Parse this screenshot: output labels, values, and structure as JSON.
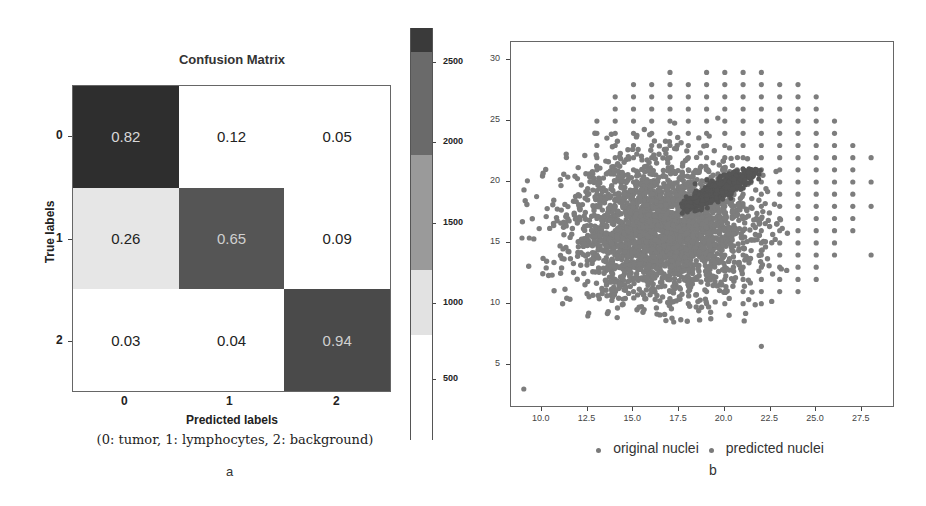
{
  "panel_a": {
    "title": "Confusion Matrix",
    "ylabel": "True labels",
    "xlabel": "Predicted labels",
    "class_note": "(0: tumor, 1: lymphocytes, 2: background)",
    "letter": "a",
    "row_ticks": [
      "0",
      "1",
      "2"
    ],
    "col_ticks": [
      "0",
      "1",
      "2"
    ],
    "cells": [
      [
        {
          "value": "0.82",
          "bg": "#2e2e2e",
          "fg": "#d8d8d8"
        },
        {
          "value": "0.12",
          "bg": "#ffffff",
          "fg": "#222222"
        },
        {
          "value": "0.05",
          "bg": "#ffffff",
          "fg": "#222222"
        }
      ],
      [
        {
          "value": "0.26",
          "bg": "#e6e6e6",
          "fg": "#222222"
        },
        {
          "value": "0.65",
          "bg": "#555555",
          "fg": "#d0d0d0"
        },
        {
          "value": "0.09",
          "bg": "#ffffff",
          "fg": "#222222"
        }
      ],
      [
        {
          "value": "0.03",
          "bg": "#ffffff",
          "fg": "#222222"
        },
        {
          "value": "0.04",
          "bg": "#ffffff",
          "fg": "#222222"
        },
        {
          "value": "0.94",
          "bg": "#4a4a4a",
          "fg": "#d0d0d0"
        }
      ]
    ],
    "colorbar": {
      "ticks": [
        {
          "label": "2500",
          "y": 62
        },
        {
          "label": "2000",
          "y": 142
        },
        {
          "label": "1500",
          "y": 223
        },
        {
          "label": "1000",
          "y": 303
        },
        {
          "label": "500",
          "y": 379
        }
      ],
      "bands": [
        {
          "color": "#3a3a3a",
          "height": 24
        },
        {
          "color": "#6a6a6a",
          "height": 103
        },
        {
          "color": "#9a9a9a",
          "height": 115
        },
        {
          "color": "#e2e2e2",
          "height": 65
        },
        {
          "color": "#ffffff",
          "height": 105
        }
      ]
    }
  },
  "panel_b": {
    "letter": "b",
    "legend": [
      {
        "label": "original nuclei",
        "color": "#7a7a7a"
      },
      {
        "label": "predicted nuclei",
        "color": "#7a7a7a"
      }
    ],
    "x_ticks": [
      "10.0",
      "12.5",
      "15.0",
      "17.5",
      "20.0",
      "22.5",
      "25.0",
      "27.5"
    ],
    "y_ticks": [
      "5",
      "10",
      "15",
      "20",
      "25",
      "30"
    ],
    "original_color": "#7d7d7d",
    "predicted_color": "#565656"
  },
  "chart_data": [
    {
      "type": "heatmap",
      "title": "Confusion Matrix",
      "xlabel": "Predicted labels",
      "ylabel": "True labels",
      "x_categories": [
        "0",
        "1",
        "2"
      ],
      "y_categories": [
        "0",
        "1",
        "2"
      ],
      "values": [
        [
          0.82,
          0.12,
          0.05
        ],
        [
          0.26,
          0.65,
          0.09
        ],
        [
          0.03,
          0.04,
          0.94
        ]
      ],
      "class_names": {
        "0": "tumor",
        "1": "lymphocytes",
        "2": "background"
      },
      "colorbar": {
        "ticks": [
          500,
          1000,
          1500,
          2000,
          2500
        ],
        "range": [
          100,
          2750
        ]
      },
      "caption": "a"
    },
    {
      "type": "scatter",
      "xlim": [
        8.3,
        29.2
      ],
      "ylim": [
        1.6,
        31.5
      ],
      "x_ticks": [
        10.0,
        12.5,
        15.0,
        17.5,
        20.0,
        22.5,
        25.0,
        27.5
      ],
      "y_ticks": [
        5,
        10,
        15,
        20,
        25,
        30
      ],
      "legend": [
        "original nuclei",
        "predicted nuclei"
      ],
      "legend_position": "bottom",
      "grid": false,
      "series": [
        {
          "name": "original nuclei",
          "description": "dense gaussian cloud centered ~(16.5, 16) spread x 9-23, y 8.5-25, plus integer-grid lattice at x 13-28, y 10-30; outliers (9, 3) and (22, 6.5)"
        },
        {
          "name": "predicted nuclei",
          "description": "compact dense cluster x ~17.5-22, y ~17-21, centered ~(20, 19.5)"
        }
      ],
      "caption": "b"
    }
  ]
}
